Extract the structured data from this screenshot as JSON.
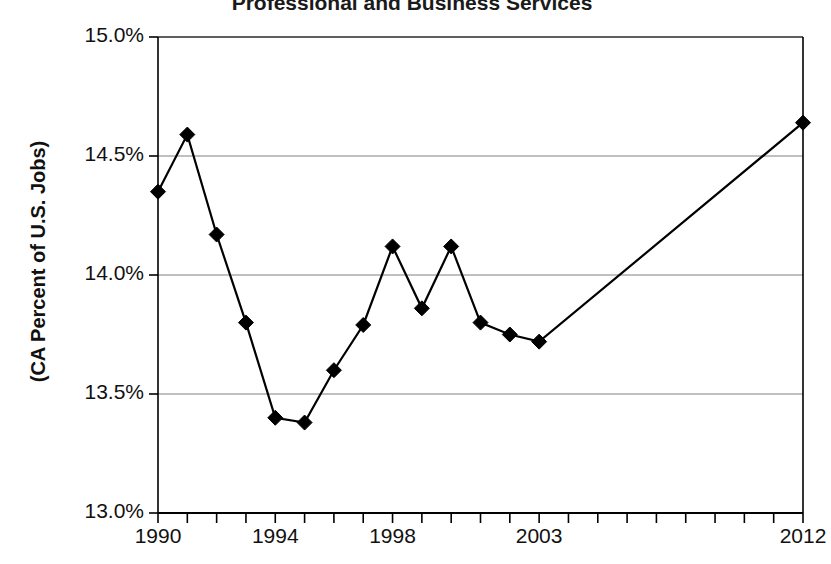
{
  "chart_data": {
    "type": "line",
    "title": "Professional and Business Services",
    "xlabel": "",
    "ylabel": "(CA Percent of U.S. Jobs)",
    "x": [
      1990,
      1991,
      1992,
      1993,
      1994,
      1995,
      1996,
      1997,
      1998,
      1999,
      2000,
      2001,
      2002,
      2003,
      2012
    ],
    "values": [
      14.35,
      14.59,
      14.17,
      13.8,
      13.4,
      13.38,
      13.6,
      13.79,
      14.12,
      13.86,
      14.12,
      13.8,
      13.75,
      13.72,
      14.64
    ],
    "series": [
      {
        "name": "CA Percent of U.S. Jobs",
        "values": [
          14.35,
          14.59,
          14.17,
          13.8,
          13.4,
          13.38,
          13.6,
          13.79,
          14.12,
          13.86,
          14.12,
          13.8,
          13.75,
          13.72,
          14.64
        ]
      }
    ],
    "xlim": [
      1990,
      2012
    ],
    "ylim": [
      13.0,
      15.0
    ],
    "ytick_labels": [
      "13.0%",
      "13.5%",
      "14.0%",
      "14.5%",
      "15.0%"
    ],
    "ytick_values": [
      13.0,
      13.5,
      14.0,
      14.5,
      15.0
    ],
    "xtick_labels": [
      "1990",
      "1994",
      "1998",
      "2003",
      "2012"
    ],
    "xtick_values": [
      1990,
      1994,
      1998,
      2003,
      2012
    ],
    "xtick_minor_values": [
      1990,
      1991,
      1992,
      1993,
      1994,
      1995,
      1996,
      1997,
      1998,
      1999,
      2000,
      2001,
      2002,
      2003,
      2004,
      2005,
      2006,
      2007,
      2008,
      2009,
      2010,
      2011,
      2012
    ],
    "grid": "horizontal",
    "legend": "none",
    "marker": "diamond",
    "line_color": "#000000",
    "marker_color": "#000000",
    "grid_color": "#808080",
    "axis_color": "#000000",
    "background_color": "#ffffff"
  }
}
